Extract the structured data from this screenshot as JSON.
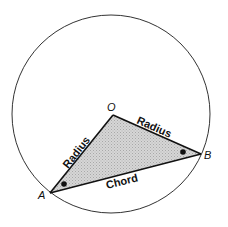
{
  "diagram": {
    "type": "circle-geometry",
    "circle": {
      "cx": 111,
      "cy": 114,
      "r": 99,
      "stroke": "#333333"
    },
    "triangle": {
      "fill": "#c9c9c9",
      "stroke": "#111111",
      "vertices": {
        "O": {
          "x": 113,
          "y": 115
        },
        "A": {
          "x": 50,
          "y": 193
        },
        "B": {
          "x": 201,
          "y": 154
        }
      }
    },
    "vertex_labels": {
      "O": "O",
      "A": "A",
      "B": "B"
    },
    "edge_labels": {
      "OA": "Radius",
      "OB": "Radius",
      "AB": "Chord"
    },
    "angle_markers": [
      {
        "at": "A",
        "x": 64,
        "y": 184,
        "shape": "dot"
      },
      {
        "at": "B",
        "x": 183,
        "y": 152,
        "shape": "dot"
      }
    ]
  }
}
